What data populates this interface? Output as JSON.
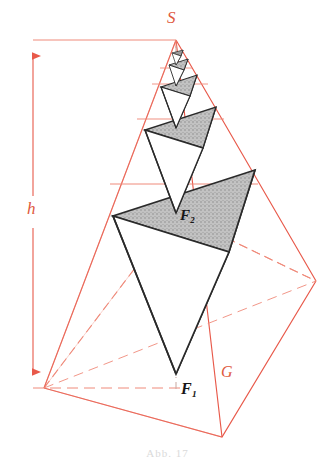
{
  "figure": {
    "caption": "Abb. 17",
    "colors": {
      "construction_red": "#e8594a",
      "construction_red_light": "#ef8a7a",
      "solid_outline": "#2a2a2a",
      "face_gray": "#b4b4b4",
      "face_gray_dark": "#8e8e8e",
      "face_stipple": "#9a9a9a",
      "background": "#ffffff",
      "caption_gray": "#dadada"
    },
    "labels": [
      {
        "id": "S",
        "text": "S",
        "meaning": "apex-of-pyramid",
        "color": "red",
        "x": 167,
        "y": 9
      },
      {
        "id": "h",
        "text": "h",
        "meaning": "pyramid-height-dimension",
        "color": "red",
        "x": 27,
        "y": 200
      },
      {
        "id": "F1",
        "text": "F₁",
        "meaning": "lowest-tetrahedron-vertex",
        "color": "black",
        "x": 181,
        "y": 381
      },
      {
        "id": "F2",
        "text": "F₂",
        "meaning": "second-tetrahedron-vertex",
        "color": "black",
        "x": 180,
        "y": 208
      },
      {
        "id": "G",
        "text": "G",
        "meaning": "base-area-of-pyramid",
        "color": "red",
        "x": 221,
        "y": 364
      }
    ],
    "geometry": {
      "apex": [
        176,
        40
      ],
      "base_vertices": {
        "left": [
          44,
          388
        ],
        "front": [
          222,
          437
        ],
        "right": [
          316,
          281
        ],
        "back_hidden": [
          176,
          214
        ]
      },
      "height_dimension": {
        "x": 33,
        "top_y": 40,
        "bottom_y": 388,
        "arrow_both_ends": true
      },
      "axis_dashdot": {
        "x": 176,
        "from_y": 45,
        "to_y": 392
      },
      "tetrahedra_levels": 5,
      "scale_ratio": 0.5
    }
  }
}
